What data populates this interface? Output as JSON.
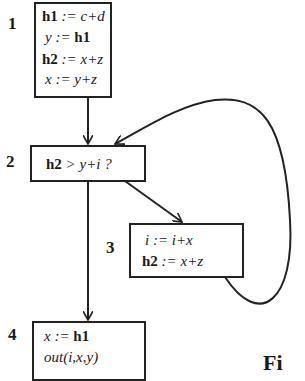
{
  "nodes": [
    {
      "id": "1",
      "label": "1",
      "lines": [
        {
          "lhs": "h1",
          "lhs_bold": true,
          "op": " := ",
          "rhs": "c+d",
          "rhs_bold": false
        },
        {
          "lhs": "y",
          "lhs_bold": false,
          "op": " := ",
          "rhs": "h1",
          "rhs_bold": true
        },
        {
          "lhs": "h2",
          "lhs_bold": true,
          "op": " := ",
          "rhs": "x+z",
          "rhs_bold": false
        },
        {
          "lhs": "x",
          "lhs_bold": false,
          "op": " := ",
          "rhs": "y+z",
          "rhs_bold": false
        }
      ]
    },
    {
      "id": "2",
      "label": "2",
      "lines": [
        {
          "lhs": "h2",
          "lhs_bold": true,
          "op": " > ",
          "rhs": "y+i ?",
          "rhs_bold": false
        }
      ]
    },
    {
      "id": "3",
      "label": "3",
      "lines": [
        {
          "lhs": "i",
          "lhs_bold": false,
          "op": " := ",
          "rhs": "i+x",
          "rhs_bold": false
        },
        {
          "lhs": "h2",
          "lhs_bold": true,
          "op": " := ",
          "rhs": "x+z",
          "rhs_bold": false
        }
      ]
    },
    {
      "id": "4",
      "label": "4",
      "lines": [
        {
          "lhs": "x",
          "lhs_bold": false,
          "op": " := ",
          "rhs": "h1",
          "rhs_bold": true
        },
        {
          "lhs": "out(i,x,y)",
          "lhs_bold": false,
          "op": "",
          "rhs": "",
          "rhs_bold": false
        }
      ]
    }
  ],
  "edges": [
    {
      "from": "1",
      "to": "2"
    },
    {
      "from": "2",
      "to": "3"
    },
    {
      "from": "3",
      "to": "2"
    },
    {
      "from": "2",
      "to": "4"
    }
  ],
  "caption": "Fi"
}
